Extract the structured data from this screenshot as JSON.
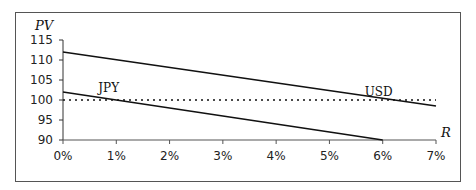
{
  "chart_data": {
    "type": "line",
    "title": "",
    "xlabel": "R",
    "ylabel": "PV",
    "x": [
      0,
      1,
      2,
      3,
      4,
      5,
      6,
      7
    ],
    "x_tick_labels": [
      "0%",
      "1%",
      "2%",
      "3%",
      "4%",
      "5%",
      "6%",
      "7%"
    ],
    "y_tick_labels": [
      "90",
      "95",
      "100",
      "105",
      "110",
      "115"
    ],
    "xlim": [
      0,
      7
    ],
    "ylim": [
      90,
      115
    ],
    "grid": false,
    "legend": "none (series labelled inline)",
    "series": [
      {
        "name": "USD",
        "style": "solid",
        "points": [
          [
            0,
            112
          ],
          [
            7,
            98.5
          ]
        ]
      },
      {
        "name": "JPY",
        "style": "solid",
        "points": [
          [
            0,
            102
          ],
          [
            6,
            90
          ]
        ]
      },
      {
        "name": "Par (100)",
        "style": "dotted",
        "points": [
          [
            0,
            100
          ],
          [
            7,
            100
          ]
        ]
      }
    ],
    "annotations": [
      {
        "text": "JPY",
        "x": 1.0,
        "y": 103
      },
      {
        "text": "USD",
        "x": 6.0,
        "y": 102
      }
    ]
  }
}
